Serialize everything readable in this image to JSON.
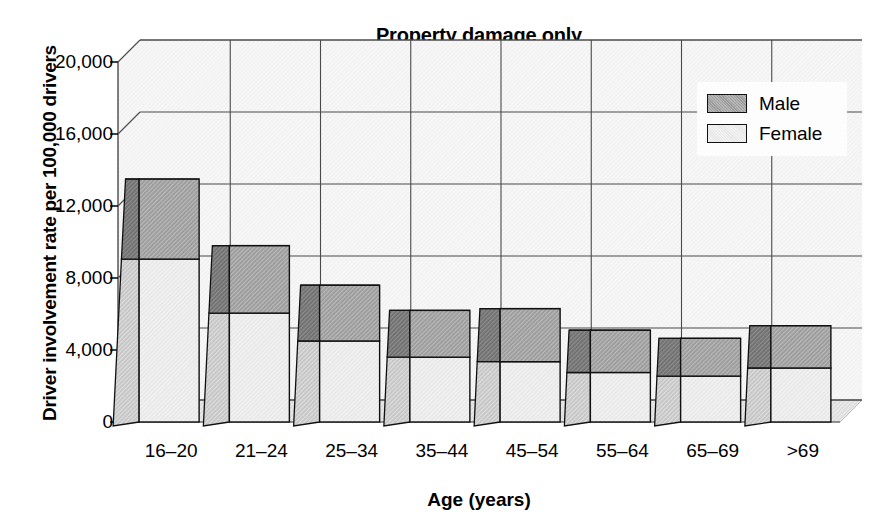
{
  "chart_data": {
    "type": "bar",
    "subtype": "stacked-3d-column",
    "title": "Property damage only",
    "xlabel": "Age (years)",
    "ylabel": "Driver involvement rate per 100,000 drivers",
    "categories": [
      "16–20",
      "21–24",
      "25–34",
      "35–44",
      "45–54",
      "55–64",
      "65–69",
      ">69"
    ],
    "series": [
      {
        "name": "Female",
        "color": "#e7e7e7",
        "values": [
          9050,
          6050,
          4500,
          3600,
          3350,
          2750,
          2550,
          3000
        ]
      },
      {
        "name": "Male",
        "color": "#9a9a9a",
        "values": [
          4450,
          3750,
          3100,
          2600,
          2950,
          2350,
          2100,
          2350
        ]
      }
    ],
    "totals": [
      13500,
      9800,
      7600,
      6200,
      6300,
      5100,
      4650,
      5350
    ],
    "ylim": [
      0,
      20000
    ],
    "yticks": [
      0,
      4000,
      8000,
      12000,
      16000,
      20000
    ],
    "ytick_labels": [
      "0",
      "4,000",
      "8,000",
      "12,000",
      "16,000",
      "20,000"
    ],
    "grid": true,
    "legend_position": "top-right",
    "legend_entries": [
      "Male",
      "Female"
    ]
  },
  "legend": {
    "male_label": "Male",
    "female_label": "Female"
  },
  "colors": {
    "male_face": "#9a9a9a",
    "male_side": "#6f6f6f",
    "female_face": "#e7e7e7",
    "female_side": "#c4c4c4",
    "plot_background": "#f1f1f1",
    "floor": "#dcdcdc",
    "gridline": "#4a4a4a",
    "outline": "#111111"
  }
}
